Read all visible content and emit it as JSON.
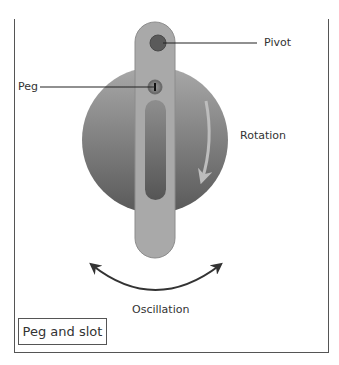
{
  "diagram": {
    "title": "Peg and slot",
    "labels": {
      "pivot": "Pivot",
      "peg": "Peg",
      "rotation": "Rotation",
      "oscillation": "Oscillation"
    },
    "colors": {
      "disc_top": "#a8a8a8",
      "disc_bottom": "#595959",
      "arm": "#a9a9a9",
      "arm_border": "#8c8c8c",
      "pivot": "#5a5a5a",
      "leader_line": "#222222",
      "rotation_arrow": "#b5b5b5",
      "oscillation_arrow": "#333333",
      "frame": "#555555"
    }
  }
}
